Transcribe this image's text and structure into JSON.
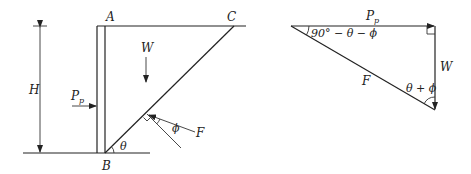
{
  "left_diagram": {
    "labels": {
      "A": "A",
      "B": "B",
      "C": "C",
      "H": "H",
      "W": "W",
      "Pp_main": "P",
      "Pp_sub": "p",
      "F": "F",
      "theta": "θ",
      "phi": "ϕ"
    }
  },
  "right_diagram": {
    "labels": {
      "Pp_main": "P",
      "Pp_sub": "p",
      "W": "W",
      "F": "F",
      "apex_angle": "90° − θ − ϕ",
      "bottom_angle": "θ + ϕ"
    }
  },
  "colors": {
    "stroke": "#222222",
    "background": "#ffffff"
  }
}
